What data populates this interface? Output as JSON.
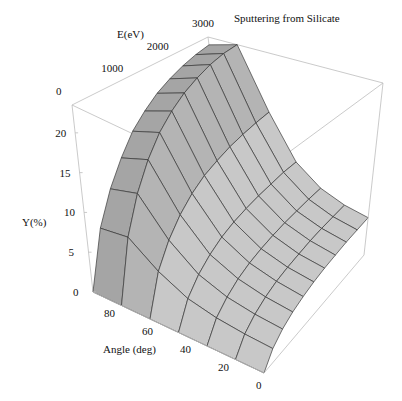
{
  "chart_data": {
    "type": "surface3d",
    "title": "Sputtering   from Silicate",
    "xlabel": "E(eV)",
    "ylabel": "Angle (deg)",
    "zlabel": "Y(%)",
    "x_ticks": [
      "0",
      "1000",
      "2000",
      "3000"
    ],
    "y_ticks": [
      "80",
      "60",
      "40",
      "20",
      "0"
    ],
    "z_ticks": [
      "0",
      "5",
      "10",
      "15",
      "20"
    ],
    "x_range": [
      0,
      3000
    ],
    "y_range": [
      0,
      90
    ],
    "z_range": [
      0,
      23.5
    ],
    "energy_eV": [
      0,
      300,
      600,
      900,
      1200,
      1500,
      1800,
      2100,
      2400,
      2700,
      3000
    ],
    "angle_deg": [
      0,
      15,
      30,
      45,
      60,
      75,
      90
    ],
    "yield_percent": [
      [
        0.0,
        0.0,
        0.0,
        0.0,
        0.0,
        0.0,
        0.0
      ],
      [
        1.6,
        1.8,
        2.2,
        3.0,
        4.8,
        7.5,
        7.0
      ],
      [
        2.6,
        2.9,
        3.5,
        4.8,
        7.6,
        12.0,
        11.0
      ],
      [
        3.3,
        3.7,
        4.5,
        6.1,
        9.7,
        15.3,
        14.0
      ],
      [
        3.8,
        4.3,
        5.2,
        7.1,
        11.3,
        17.8,
        16.5
      ],
      [
        4.2,
        4.7,
        5.7,
        7.8,
        12.5,
        19.6,
        18.2
      ],
      [
        4.5,
        5.0,
        6.1,
        8.3,
        13.3,
        21.0,
        19.6
      ],
      [
        4.7,
        5.3,
        6.4,
        8.7,
        14.0,
        22.0,
        20.6
      ],
      [
        4.9,
        5.5,
        6.6,
        9.0,
        14.5,
        22.8,
        21.4
      ],
      [
        5.0,
        5.6,
        6.8,
        9.3,
        14.9,
        23.3,
        22.0
      ],
      [
        5.1,
        5.7,
        6.9,
        9.4,
        15.2,
        23.5,
        22.4
      ]
    ],
    "grid": false,
    "shading": "gray"
  }
}
